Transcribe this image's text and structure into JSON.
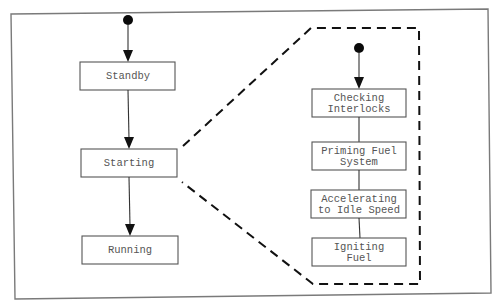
{
  "diagram": {
    "type": "state-machine",
    "main_states": [
      {
        "id": "standby",
        "label": "Standby"
      },
      {
        "id": "starting",
        "label": "Starting"
      },
      {
        "id": "running",
        "label": "Running"
      }
    ],
    "substates_of": "Starting",
    "sub_states": [
      {
        "id": "checking-interlocks",
        "line1": "Checking",
        "line2": "Interlocks"
      },
      {
        "id": "priming-fuel-system",
        "line1": "Priming Fuel",
        "line2": "System"
      },
      {
        "id": "accelerating",
        "line1": "Accelerating",
        "line2": "to Idle Speed"
      },
      {
        "id": "igniting-fuel",
        "line1": "Igniting",
        "line2": "Fuel"
      }
    ],
    "transitions": [
      {
        "from": "initial",
        "to": "Standby"
      },
      {
        "from": "Standby",
        "to": "Starting"
      },
      {
        "from": "Starting",
        "to": "Running"
      },
      {
        "from": "initial",
        "to": "Checking Interlocks"
      },
      {
        "from": "Checking Interlocks",
        "to": "Priming Fuel System"
      },
      {
        "from": "Priming Fuel System",
        "to": "Accelerating to Idle Speed"
      },
      {
        "from": "Accelerating to Idle Speed",
        "to": "Igniting Fuel"
      }
    ]
  }
}
